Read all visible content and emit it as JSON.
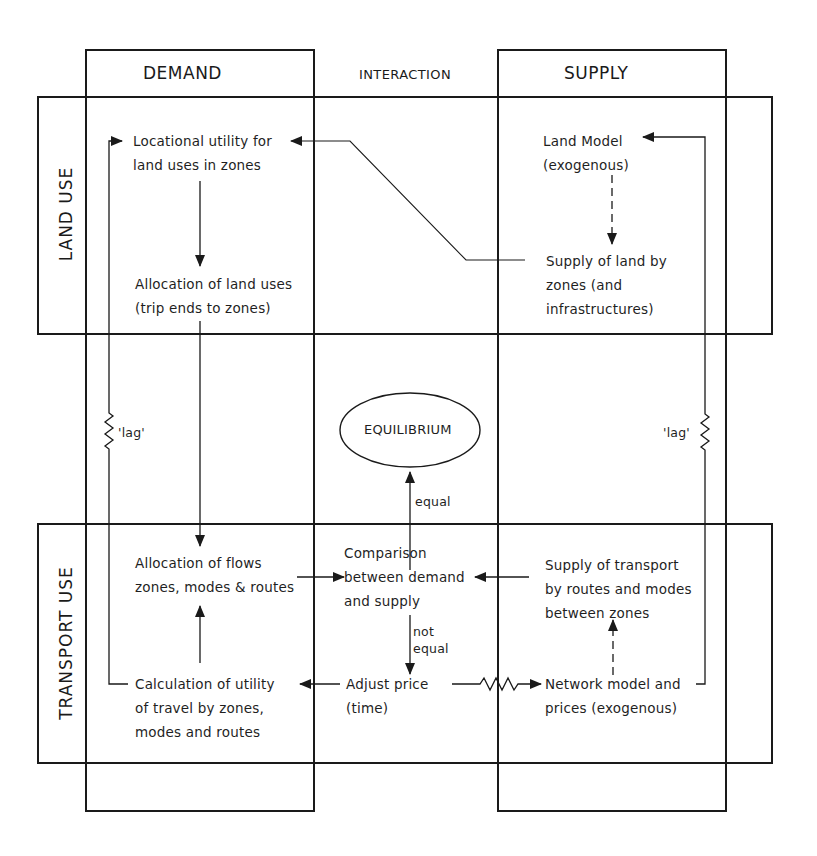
{
  "columns": {
    "demand": "DEMAND",
    "interaction": "INTERACTION",
    "supply": "SUPPLY"
  },
  "rows": {
    "land_use": "LAND USE",
    "transport_use": "TRANSPORT USE"
  },
  "nodes": {
    "locational_utility": [
      "Locational utility for",
      "land uses in zones"
    ],
    "allocation_land_uses": [
      "Allocation of land uses",
      "(trip ends to zones)"
    ],
    "land_model": [
      "Land Model",
      "(exogenous)"
    ],
    "supply_of_land": [
      "Supply of land by",
      "zones (and",
      "infrastructures)"
    ],
    "equilibrium": "EQUILIBRIUM",
    "allocation_flows": [
      "Allocation of flows",
      "zones, modes & routes"
    ],
    "comparison": [
      "Comparison",
      "between demand",
      "and supply"
    ],
    "supply_transport": [
      "Supply of transport",
      "by routes and modes",
      "between zones"
    ],
    "calculation_utility": [
      "Calculation of utility",
      "of travel by zones,",
      "modes and routes"
    ],
    "adjust_price": [
      "Adjust price",
      "(time)"
    ],
    "network_model": [
      "Network model and",
      "prices (exogenous)"
    ]
  },
  "edge_labels": {
    "lag_left": "'lag'",
    "lag_right": "'lag'",
    "equal": "equal",
    "not_equal": [
      "not",
      "equal"
    ]
  },
  "colors": {
    "ink": "#1a1a1a",
    "paper": "#ffffff"
  }
}
